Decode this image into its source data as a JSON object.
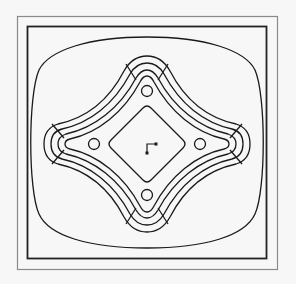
{
  "diagram": {
    "title": "",
    "colors": {
      "background": "#f7f7f7",
      "outer_frame": "#8a8a8a",
      "inner_frame": "#222222",
      "stroke": "#1a1a1a"
    },
    "elements": {
      "outer_frame": "outer frame",
      "inner_frame": "inner frame",
      "cushion_outline": "rounded outline",
      "star_groove": "four-lobed groove (3 tracks)",
      "holes": [
        "top hole",
        "right hole",
        "bottom hole",
        "left hole"
      ],
      "center_pocket": "rotated square pocket",
      "origin_marker": "origin marker"
    }
  }
}
